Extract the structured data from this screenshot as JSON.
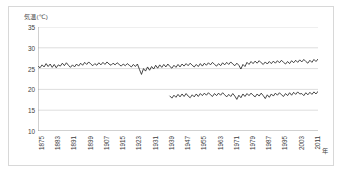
{
  "chart_data": {
    "type": "line",
    "title": "",
    "ylabel": "気温(℃)",
    "xlabel": "年",
    "ylim": [
      10,
      35
    ],
    "yticks": [
      10,
      15,
      20,
      25,
      30,
      35
    ],
    "xlim": [
      1875,
      2013
    ],
    "xticks": [
      1875,
      1883,
      1891,
      1899,
      1907,
      1915,
      1923,
      1931,
      1939,
      1947,
      1955,
      1963,
      1971,
      1979,
      1987,
      1995,
      2003,
      2011
    ],
    "grid": true,
    "legend": "none",
    "line_color": "#1a1a1a",
    "grid_color": "#d0d0d0",
    "series": [
      {
        "name": "upper-series",
        "x_start": 1875,
        "values": [
          25.6,
          25.2,
          25.9,
          25.4,
          26.2,
          25.5,
          26.1,
          25.3,
          26.0,
          25.2,
          25.9,
          25.6,
          26.3,
          25.7,
          26.4,
          25.8,
          25.3,
          25.9,
          25.4,
          26.1,
          25.6,
          26.3,
          25.8,
          26.5,
          26.0,
          26.6,
          26.1,
          25.7,
          26.2,
          25.8,
          26.4,
          25.9,
          26.5,
          26.0,
          26.6,
          26.1,
          25.8,
          26.3,
          25.9,
          26.4,
          26.0,
          25.6,
          26.1,
          25.7,
          26.2,
          25.8,
          25.4,
          26.0,
          25.5,
          26.1,
          24.8,
          23.6,
          25.0,
          24.4,
          25.4,
          24.6,
          25.5,
          24.9,
          25.8,
          25.1,
          25.9,
          25.3,
          26.0,
          25.4,
          26.1,
          25.5,
          25.1,
          25.8,
          25.3,
          26.0,
          25.4,
          26.1,
          25.6,
          26.2,
          25.7,
          26.3,
          25.8,
          25.4,
          26.0,
          25.5,
          26.2,
          25.6,
          26.3,
          25.8,
          26.4,
          25.9,
          26.5,
          26.0,
          25.6,
          26.2,
          25.7,
          26.4,
          25.9,
          26.5,
          26.0,
          26.6,
          26.1,
          25.7,
          26.3,
          25.8,
          24.9,
          26.0,
          25.5,
          26.5,
          26.0,
          26.7,
          26.2,
          26.8,
          26.3,
          26.9,
          26.4,
          26.0,
          26.6,
          26.1,
          26.7,
          26.2,
          26.8,
          26.3,
          26.9,
          26.4,
          27.0,
          26.5,
          26.1,
          26.7,
          26.2,
          26.9,
          26.4,
          27.0,
          26.5,
          27.1,
          26.6,
          27.2,
          26.7,
          26.3,
          27.0,
          26.5,
          27.2,
          26.7,
          27.3,
          26.8
        ]
      },
      {
        "name": "lower-series",
        "x_start": 1940,
        "values": [
          18.4,
          17.9,
          18.6,
          18.1,
          18.8,
          18.2,
          18.9,
          18.3,
          19.0,
          18.4,
          18.0,
          18.7,
          18.2,
          18.9,
          18.3,
          19.0,
          18.5,
          19.1,
          18.6,
          19.2,
          18.7,
          18.3,
          19.0,
          18.5,
          19.1,
          18.6,
          19.2,
          18.7,
          18.2,
          18.8,
          18.3,
          19.0,
          18.4,
          17.6,
          18.6,
          18.0,
          18.9,
          18.3,
          19.0,
          18.5,
          19.1,
          18.6,
          18.2,
          18.9,
          18.4,
          19.1,
          18.5,
          17.8,
          18.7,
          18.1,
          18.9,
          18.4,
          19.1,
          18.6,
          19.2,
          18.7,
          18.3,
          19.0,
          18.5,
          19.2,
          18.6,
          19.3,
          18.8,
          19.4,
          18.9,
          19.0,
          18.5,
          19.2,
          18.7,
          19.3,
          18.8,
          19.4,
          18.9,
          19.5,
          19.0,
          18.6
        ]
      }
    ]
  }
}
